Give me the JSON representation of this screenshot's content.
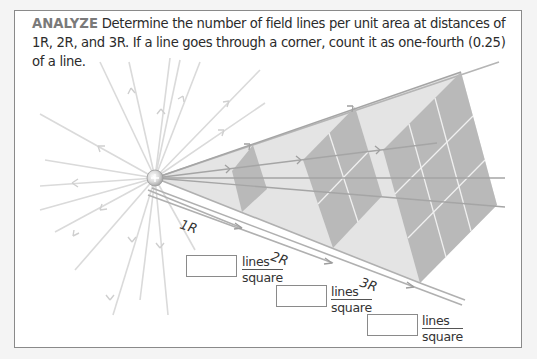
{
  "prompt": {
    "keyword": "ANALYZE",
    "text": " Determine the number of field lines per unit area at distances of 1R, 2R, and 3R. If a line goes through a corner, count it as one-fourth (0.25) of a line."
  },
  "figure": {
    "charge_symbol": "+",
    "charge_icon": "positive-charge-icon",
    "distance_labels": [
      "1R",
      "2R",
      "3R"
    ],
    "colors": {
      "field_line": "#d6d6d6",
      "pyramid_fill": "#e2e2e2",
      "square_fill": "#b8b8b8",
      "grid_line": "#f2f2f2",
      "axis_line": "#a8a8a8"
    }
  },
  "answers": [
    {
      "distance": "1R",
      "value": "",
      "unit_numerator": "lines",
      "unit_denominator": "square"
    },
    {
      "distance": "2R",
      "value": "",
      "unit_numerator": "lines",
      "unit_denominator": "square"
    },
    {
      "distance": "3R",
      "value": "",
      "unit_numerator": "lines",
      "unit_denominator": "square"
    }
  ]
}
